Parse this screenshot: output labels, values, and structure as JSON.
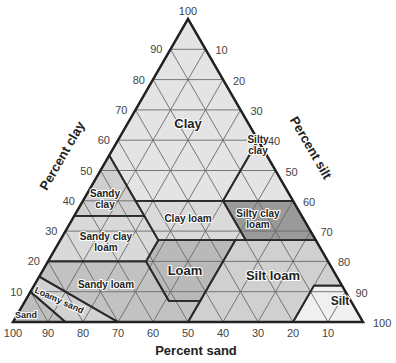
{
  "chart_data": {
    "type": "ternary",
    "title": "",
    "axes": {
      "clay": {
        "label": "Percent clay",
        "ticks": [
          10,
          20,
          30,
          40,
          50,
          60,
          70,
          80,
          90,
          100
        ]
      },
      "silt": {
        "label": "Percent silt",
        "ticks": [
          10,
          20,
          30,
          40,
          50,
          60,
          70,
          80,
          90,
          100
        ]
      },
      "sand": {
        "label": "Percent sand",
        "ticks": [
          100,
          90,
          80,
          70,
          60,
          50,
          40,
          30,
          20,
          10
        ]
      }
    },
    "grid": true,
    "regions": [
      {
        "name": "Clay",
        "label": "Clay",
        "color": "#e4e4e4",
        "vertices_clay_silt": [
          [
            100,
            0
          ],
          [
            60,
            40
          ],
          [
            40,
            40
          ],
          [
            40,
            15
          ],
          [
            55,
            0
          ]
        ]
      },
      {
        "name": "Silty clay",
        "label": "Silty\nclay",
        "color": "#e4e4e4",
        "vertices_clay_silt": [
          [
            60,
            40
          ],
          [
            40,
            60
          ],
          [
            40,
            40
          ]
        ]
      },
      {
        "name": "Sandy clay",
        "label": "Sandy\nclay",
        "color": "#cfcfcf",
        "vertices_clay_silt": [
          [
            55,
            0
          ],
          [
            40,
            15
          ],
          [
            35,
            20
          ],
          [
            35,
            0
          ]
        ]
      },
      {
        "name": "Clay loam",
        "label": "Clay loam",
        "color": "#dadada",
        "vertices_clay_silt": [
          [
            40,
            15
          ],
          [
            40,
            40
          ],
          [
            27,
            53
          ],
          [
            27,
            28
          ],
          [
            35,
            20
          ]
        ]
      },
      {
        "name": "Silty clay loam",
        "label": "Silty clay\nloam",
        "color": "#9a9a9a",
        "vertices_clay_silt": [
          [
            40,
            40
          ],
          [
            40,
            60
          ],
          [
            27,
            73
          ],
          [
            27,
            53
          ]
        ]
      },
      {
        "name": "Sandy clay loam",
        "label": "Sandy clay\nloam",
        "color": "#d9d9d9",
        "vertices_clay_silt": [
          [
            35,
            0
          ],
          [
            35,
            20
          ],
          [
            27,
            28
          ],
          [
            20,
            28
          ],
          [
            20,
            0
          ]
        ]
      },
      {
        "name": "Loam",
        "label": "Loam",
        "color": "#b9b9b9",
        "vertices_clay_silt": [
          [
            27,
            28
          ],
          [
            27,
            50
          ],
          [
            7,
            50
          ],
          [
            7,
            41
          ],
          [
            20,
            28
          ]
        ]
      },
      {
        "name": "Silt loam",
        "label": "Silt loam",
        "color": "#d0d0d0",
        "vertices_clay_silt": [
          [
            27,
            50
          ],
          [
            27,
            73
          ],
          [
            12,
            88
          ],
          [
            12,
            80
          ],
          [
            0,
            80
          ],
          [
            0,
            50
          ],
          [
            7,
            50
          ]
        ]
      },
      {
        "name": "Silt",
        "label": "Silt",
        "color": "#f0f0f0",
        "vertices_clay_silt": [
          [
            12,
            80
          ],
          [
            12,
            88
          ],
          [
            0,
            100
          ],
          [
            0,
            80
          ]
        ]
      },
      {
        "name": "Sandy loam",
        "label": "Sandy loam",
        "color": "#c2c2c2",
        "vertices_clay_silt": [
          [
            20,
            0
          ],
          [
            20,
            28
          ],
          [
            7,
            41
          ],
          [
            7,
            50
          ],
          [
            0,
            50
          ],
          [
            0,
            30
          ],
          [
            15,
            0
          ]
        ]
      },
      {
        "name": "Loamy sand",
        "label": "Loamy sand",
        "color": "#d2d2d2",
        "vertices_clay_silt": [
          [
            15,
            0
          ],
          [
            0,
            30
          ],
          [
            0,
            15
          ],
          [
            10,
            0
          ]
        ]
      },
      {
        "name": "Sand",
        "label": "Sand",
        "color": "#bdbdbd",
        "vertices_clay_silt": [
          [
            10,
            0
          ],
          [
            0,
            15
          ],
          [
            0,
            0
          ]
        ]
      }
    ]
  },
  "labels": {
    "clay_axis": "Percent clay",
    "silt_axis": "Percent silt",
    "sand_axis": "Percent sand"
  }
}
